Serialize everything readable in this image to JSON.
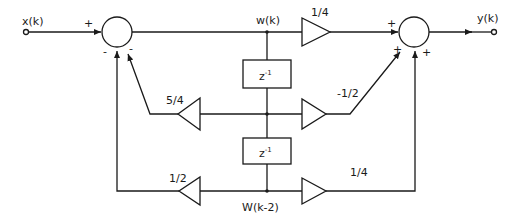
{
  "diagram": {
    "type": "signal-flow block diagram (second-order IIR filter, direct form II)",
    "input_label": "x(k)",
    "output_label": "y(k)",
    "node_top_label": "w(k)",
    "node_bottom_label": "W(k-2)",
    "delay_blocks": [
      {
        "label": "z",
        "exponent": "-1"
      },
      {
        "label": "z",
        "exponent": "-1"
      }
    ],
    "gains": {
      "forward_top": "1/4",
      "forward_middle": "-1/2",
      "forward_bottom": "1/4",
      "feedback_middle": "5/4",
      "feedback_bottom": "1/2"
    },
    "summer_input": {
      "signs": [
        "+",
        "-",
        "-"
      ]
    },
    "summer_output": {
      "signs": [
        "+",
        "+",
        "+"
      ]
    }
  }
}
